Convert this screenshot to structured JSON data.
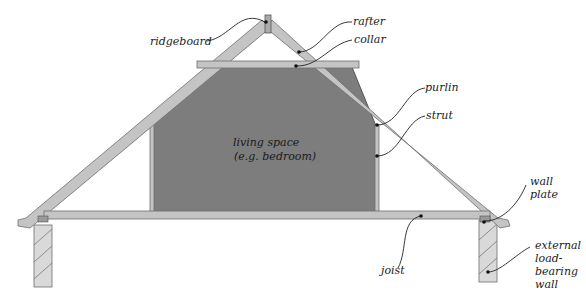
{
  "diagram": {
    "type": "roof-truss-cross-section",
    "room": {
      "line1": "living space",
      "line2": "(e.g. bedroom)"
    },
    "labels": {
      "ridgeboard": "ridgeboard",
      "rafter": "rafter",
      "collar": "collar",
      "purlin": "purlin",
      "strut": "strut",
      "wall_plate_1": "wall",
      "wall_plate_2": "plate",
      "joist": "joist",
      "wall_1": "external",
      "wall_2": "load-",
      "wall_3": "bearing",
      "wall_4": "wall"
    },
    "colors": {
      "timber": "#c4c4c4",
      "timber_edge": "#6e6e6e",
      "room_fill": "#7d7d7d",
      "wall_fill": "#d9d9d9",
      "hatch": "#777777",
      "leader": "#222222"
    }
  }
}
